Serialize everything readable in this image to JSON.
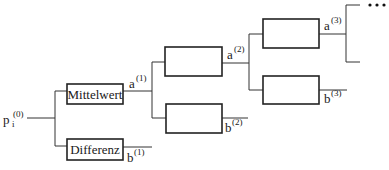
{
  "diagram": {
    "type": "wavelet-packet-tree",
    "input": {
      "base": "p",
      "subscript": "i",
      "superscript": "(0)",
      "x": 3,
      "y": 124
    },
    "boxes": [
      {
        "id": "mittelwert",
        "label": "Mittelwert",
        "x": 67,
        "y": 84,
        "w": 56,
        "h": 20
      },
      {
        "id": "differenz",
        "label": "Differenz",
        "x": 67,
        "y": 139,
        "w": 56,
        "h": 21
      },
      {
        "id": "l2-top",
        "label": "",
        "x": 165,
        "y": 47,
        "w": 57,
        "h": 29
      },
      {
        "id": "l2-bottom",
        "label": "",
        "x": 166,
        "y": 104,
        "w": 56,
        "h": 29
      },
      {
        "id": "l3-top",
        "label": "",
        "x": 263,
        "y": 19,
        "w": 56,
        "h": 29
      },
      {
        "id": "l3-bottom",
        "label": "",
        "x": 263,
        "y": 76,
        "w": 56,
        "h": 28
      }
    ],
    "outputs": [
      {
        "name": "a",
        "sup": "(1)",
        "x": 129,
        "y": 87
      },
      {
        "name": "b",
        "sup": "(1)",
        "x": 127,
        "y": 160
      },
      {
        "name": "a",
        "sup": "(2)",
        "x": 227,
        "y": 58
      },
      {
        "name": "b",
        "sup": "(2)",
        "x": 225,
        "y": 131
      },
      {
        "name": "a",
        "sup": "(3)",
        "x": 324,
        "y": 29
      },
      {
        "name": "b",
        "sup": "(3)",
        "x": 324,
        "y": 102
      }
    ],
    "ellipsis": "•••"
  }
}
